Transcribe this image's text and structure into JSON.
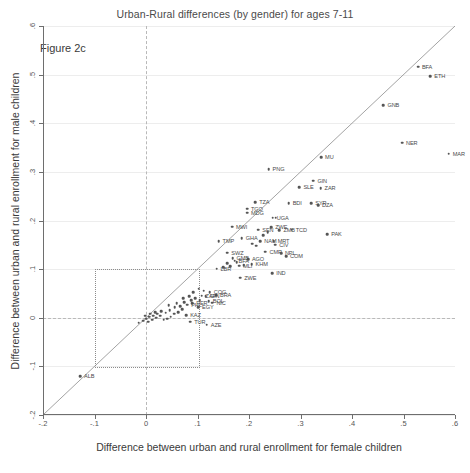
{
  "chart_data": {
    "type": "scatter",
    "title": "Urban-Rural differences (by gender) for ages 7-11",
    "annotation": "Figure 2c",
    "xlabel": "Difference between urban and rural enrollment for female children",
    "ylabel": "Difference between urban and rural enrollment for male children",
    "xlim": [
      -0.2,
      0.6
    ],
    "ylim": [
      -0.2,
      0.6
    ],
    "xticks": [
      "-.2",
      "-.1",
      "0",
      ".1",
      ".2",
      ".3",
      ".4",
      ".5",
      ".6"
    ],
    "xtickvals": [
      -0.2,
      -0.1,
      0,
      0.1,
      0.2,
      0.3,
      0.4,
      0.5,
      0.6
    ],
    "yticks": [
      "-.2",
      "-.1",
      "0",
      ".1",
      ".2",
      ".3",
      ".4",
      ".5",
      ".6"
    ],
    "ytickvals": [
      -0.2,
      -0.1,
      0,
      0.1,
      0.2,
      0.3,
      0.4,
      0.5,
      0.6
    ],
    "grid": true,
    "legend": "none",
    "reference_lines": [
      {
        "name": "identity-line",
        "type": "diagonal",
        "from": [
          -0.2,
          -0.2
        ],
        "to": [
          0.6,
          0.6
        ]
      },
      {
        "name": "zero-vertical",
        "type": "vertical",
        "value": 0,
        "style": "dashed"
      },
      {
        "name": "zero-horizontal",
        "type": "horizontal",
        "value": 0,
        "style": "dashed"
      }
    ],
    "highlight_box": {
      "x0": -0.1,
      "x1": 0.1,
      "y0": -0.1,
      "y1": 0.1,
      "style": "dotted"
    },
    "point_color": "#555555",
    "line_color": "#8c8c8c",
    "points": [
      {
        "label": "ETH",
        "x": 0.552,
        "y": 0.497,
        "lx": 4,
        "ly": 0
      },
      {
        "label": "BFA",
        "x": 0.528,
        "y": 0.516,
        "lx": 4,
        "ly": 0
      },
      {
        "label": "GNB",
        "x": 0.461,
        "y": 0.437,
        "lx": 4,
        "ly": 0
      },
      {
        "label": "MAR",
        "x": 0.588,
        "y": 0.337,
        "lx": 4,
        "ly": 0
      },
      {
        "label": "NER",
        "x": 0.497,
        "y": 0.36,
        "lx": 4,
        "ly": 0
      },
      {
        "label": "MU",
        "x": 0.34,
        "y": 0.33,
        "lx": 4,
        "ly": 0
      },
      {
        "label": "GIN",
        "x": 0.325,
        "y": 0.282,
        "lx": 4,
        "ly": 0
      },
      {
        "label": "SLE",
        "x": 0.298,
        "y": 0.268,
        "lx": 4,
        "ly": 0
      },
      {
        "label": "ZAR",
        "x": 0.339,
        "y": 0.266,
        "lx": 4,
        "ly": 0
      },
      {
        "label": "PNG",
        "x": 0.238,
        "y": 0.305,
        "lx": 4,
        "ly": 0
      },
      {
        "label": "TZA",
        "x": 0.212,
        "y": 0.238,
        "lx": 4,
        "ly": 0
      },
      {
        "label": "BDI",
        "x": 0.277,
        "y": 0.236,
        "lx": 4,
        "ly": 0
      },
      {
        "label": "SYR",
        "x": 0.321,
        "y": 0.236,
        "lx": 4,
        "ly": 0
      },
      {
        "label": "DZA",
        "x": 0.334,
        "y": 0.232,
        "lx": 4,
        "ly": 0
      },
      {
        "label": "TGO",
        "x": 0.196,
        "y": 0.224,
        "lx": 4,
        "ly": 0
      },
      {
        "label": "MDG",
        "x": 0.196,
        "y": 0.216,
        "lx": 4,
        "ly": 0
      },
      {
        "label": "UGA",
        "x": 0.246,
        "y": 0.206,
        "lx": 4,
        "ly": 0
      },
      {
        "label": "SEN",
        "x": 0.218,
        "y": 0.181,
        "lx": 4,
        "ly": 0
      },
      {
        "label": "ZWE",
        "x": 0.243,
        "y": 0.186,
        "lx": 4,
        "ly": 0
      },
      {
        "label": "ZMB",
        "x": 0.259,
        "y": 0.18,
        "lx": 4,
        "ly": 0
      },
      {
        "label": "TCD",
        "x": 0.283,
        "y": 0.181,
        "lx": 4,
        "ly": 0
      },
      {
        "label": "PAK",
        "x": 0.352,
        "y": 0.172,
        "lx": 4,
        "ly": 0
      },
      {
        "label": "MWI",
        "x": 0.167,
        "y": 0.187,
        "lx": 4,
        "ly": 0
      },
      {
        "label": "GHA",
        "x": 0.186,
        "y": 0.163,
        "lx": 4,
        "ly": 0
      },
      {
        "label": "TMP",
        "x": 0.141,
        "y": 0.158,
        "lx": 4,
        "ly": 0
      },
      {
        "label": "NAM",
        "x": 0.222,
        "y": 0.157,
        "lx": 4,
        "ly": 0
      },
      {
        "label": "MRT",
        "x": 0.248,
        "y": 0.158,
        "lx": 4,
        "ly": 0
      },
      {
        "label": "CIV",
        "x": 0.251,
        "y": 0.15,
        "lx": 4,
        "ly": 0
      },
      {
        "label": "SWZ",
        "x": 0.158,
        "y": 0.134,
        "lx": 4,
        "ly": 0
      },
      {
        "label": "CMR",
        "x": 0.232,
        "y": 0.136,
        "lx": 4,
        "ly": 0
      },
      {
        "label": "NPL",
        "x": 0.262,
        "y": 0.133,
        "lx": 4,
        "ly": 0
      },
      {
        "label": "COM",
        "x": 0.272,
        "y": 0.127,
        "lx": 4,
        "ly": 0
      },
      {
        "label": "AGO",
        "x": 0.198,
        "y": 0.12,
        "lx": 4,
        "ly": 0
      },
      {
        "label": "GMB",
        "x": 0.168,
        "y": 0.122,
        "lx": 4,
        "ly": 0
      },
      {
        "label": "BFA2",
        "x": 0.172,
        "y": 0.117,
        "lx": 4,
        "ly": 0
      },
      {
        "label": "KHM",
        "x": 0.205,
        "y": 0.11,
        "lx": 4,
        "ly": 0
      },
      {
        "label": "MLI",
        "x": 0.181,
        "y": 0.107,
        "lx": 4,
        "ly": 0
      },
      {
        "label": "LBR",
        "x": 0.137,
        "y": 0.101,
        "lx": 4,
        "ly": 0
      },
      {
        "label": "IND",
        "x": 0.245,
        "y": 0.092,
        "lx": 4,
        "ly": 0
      },
      {
        "label": "ZWE2",
        "x": 0.183,
        "y": 0.082,
        "lx": 4,
        "ly": 0
      },
      {
        "label": "COG",
        "x": 0.124,
        "y": 0.053,
        "lx": 4,
        "ly": 0
      },
      {
        "label": "BRA",
        "x": 0.136,
        "y": 0.046,
        "lx": 4,
        "ly": 0
      },
      {
        "label": "ZAF",
        "x": 0.108,
        "y": 0.045,
        "lx": 4,
        "ly": 0
      },
      {
        "label": "GIN2",
        "x": 0.116,
        "y": 0.044,
        "lx": 4,
        "ly": 0
      },
      {
        "label": "BOL",
        "x": 0.122,
        "y": 0.034,
        "lx": 4,
        "ly": 0
      },
      {
        "label": "NIC",
        "x": 0.129,
        "y": 0.031,
        "lx": 4,
        "ly": 0
      },
      {
        "label": "PER",
        "x": 0.09,
        "y": 0.03,
        "lx": 4,
        "ly": 0
      },
      {
        "label": "PHL",
        "x": 0.08,
        "y": 0.027,
        "lx": 4,
        "ly": 0
      },
      {
        "label": "EGY",
        "x": 0.101,
        "y": 0.022,
        "lx": 4,
        "ly": 0
      },
      {
        "label": "KAZ",
        "x": 0.078,
        "y": 0.005,
        "lx": 4,
        "ly": 0
      },
      {
        "label": "TUR",
        "x": 0.086,
        "y": -0.008,
        "lx": 4,
        "ly": 0
      },
      {
        "label": "AZE",
        "x": 0.118,
        "y": -0.014,
        "lx": 4,
        "ly": 0
      },
      {
        "label": "ALB",
        "x": -0.128,
        "y": -0.12,
        "lx": 4,
        "ly": 0
      },
      {
        "label": "",
        "x": 0.095,
        "y": 0.04,
        "lx": 0,
        "ly": 0
      },
      {
        "label": "",
        "x": 0.088,
        "y": 0.036,
        "lx": 0,
        "ly": 0
      },
      {
        "label": "",
        "x": 0.104,
        "y": 0.036,
        "lx": 0,
        "ly": 0
      },
      {
        "label": "",
        "x": 0.07,
        "y": 0.018,
        "lx": 0,
        "ly": 0
      },
      {
        "label": "",
        "x": 0.062,
        "y": 0.012,
        "lx": 0,
        "ly": 0
      },
      {
        "label": "",
        "x": 0.055,
        "y": 0.008,
        "lx": 0,
        "ly": 0
      },
      {
        "label": "",
        "x": 0.048,
        "y": 0.002,
        "lx": 0,
        "ly": 0
      },
      {
        "label": "",
        "x": 0.041,
        "y": -0.002,
        "lx": 0,
        "ly": 0
      },
      {
        "label": "",
        "x": 0.034,
        "y": -0.004,
        "lx": 0,
        "ly": 0
      },
      {
        "label": "",
        "x": 0.028,
        "y": 0.004,
        "lx": 0,
        "ly": 0
      },
      {
        "label": "",
        "x": 0.02,
        "y": 0.0,
        "lx": 0,
        "ly": 0
      },
      {
        "label": "",
        "x": 0.012,
        "y": -0.004,
        "lx": 0,
        "ly": 0
      },
      {
        "label": "",
        "x": 0.004,
        "y": -0.008,
        "lx": 0,
        "ly": 0
      },
      {
        "label": "",
        "x": -0.006,
        "y": -0.006,
        "lx": 0,
        "ly": 0
      },
      {
        "label": "",
        "x": -0.014,
        "y": -0.01,
        "lx": 0,
        "ly": 0
      },
      {
        "label": "",
        "x": 0.06,
        "y": 0.03,
        "lx": 0,
        "ly": 0
      },
      {
        "label": "",
        "x": 0.066,
        "y": 0.024,
        "lx": 0,
        "ly": 0
      },
      {
        "label": "",
        "x": 0.074,
        "y": 0.032,
        "lx": 0,
        "ly": 0
      },
      {
        "label": "",
        "x": 0.046,
        "y": 0.016,
        "lx": 0,
        "ly": 0
      },
      {
        "label": "",
        "x": 0.038,
        "y": 0.01,
        "lx": 0,
        "ly": 0
      },
      {
        "label": "",
        "x": 0.03,
        "y": 0.014,
        "lx": 0,
        "ly": 0
      },
      {
        "label": "",
        "x": 0.022,
        "y": 0.008,
        "lx": 0,
        "ly": 0
      },
      {
        "label": "",
        "x": 0.014,
        "y": 0.004,
        "lx": 0,
        "ly": 0
      },
      {
        "label": "",
        "x": 0.006,
        "y": 0.002,
        "lx": 0,
        "ly": 0
      },
      {
        "label": "",
        "x": 0.0,
        "y": -0.002,
        "lx": 0,
        "ly": 0
      },
      {
        "label": "",
        "x": 0.092,
        "y": 0.052,
        "lx": 0,
        "ly": 0
      },
      {
        "label": "",
        "x": 0.112,
        "y": 0.056,
        "lx": 0,
        "ly": 0
      },
      {
        "label": "",
        "x": 0.158,
        "y": 0.112,
        "lx": 0,
        "ly": 0
      },
      {
        "label": "",
        "x": 0.15,
        "y": 0.104,
        "lx": 0,
        "ly": 0
      },
      {
        "label": "",
        "x": 0.164,
        "y": 0.106,
        "lx": 0,
        "ly": 0
      },
      {
        "label": "",
        "x": 0.176,
        "y": 0.114,
        "lx": 0,
        "ly": 0
      },
      {
        "label": "",
        "x": 0.19,
        "y": 0.108,
        "lx": 0,
        "ly": 0
      },
      {
        "label": "",
        "x": 0.214,
        "y": 0.148,
        "lx": 0,
        "ly": 0
      },
      {
        "label": "",
        "x": 0.206,
        "y": 0.152,
        "lx": 0,
        "ly": 0
      },
      {
        "label": "",
        "x": 0.236,
        "y": 0.176,
        "lx": 0,
        "ly": 0
      },
      {
        "label": "",
        "x": 0.228,
        "y": 0.17,
        "lx": 0,
        "ly": 0
      },
      {
        "label": "",
        "x": 0.252,
        "y": 0.206,
        "lx": 0,
        "ly": 0
      },
      {
        "label": "",
        "x": 0.102,
        "y": 0.06,
        "lx": 0,
        "ly": 0
      },
      {
        "label": "",
        "x": 0.084,
        "y": 0.044,
        "lx": 0,
        "ly": 0
      },
      {
        "label": "",
        "x": 0.072,
        "y": 0.04,
        "lx": 0,
        "ly": 0
      },
      {
        "label": "",
        "x": 0.056,
        "y": 0.022,
        "lx": 0,
        "ly": 0
      },
      {
        "label": "",
        "x": 0.044,
        "y": 0.026,
        "lx": 0,
        "ly": 0
      },
      {
        "label": "",
        "x": 0.018,
        "y": 0.012,
        "lx": 0,
        "ly": 0
      },
      {
        "label": "",
        "x": 0.008,
        "y": 0.008,
        "lx": 0,
        "ly": 0
      },
      {
        "label": "",
        "x": -0.002,
        "y": 0.004,
        "lx": 0,
        "ly": 0
      }
    ]
  }
}
